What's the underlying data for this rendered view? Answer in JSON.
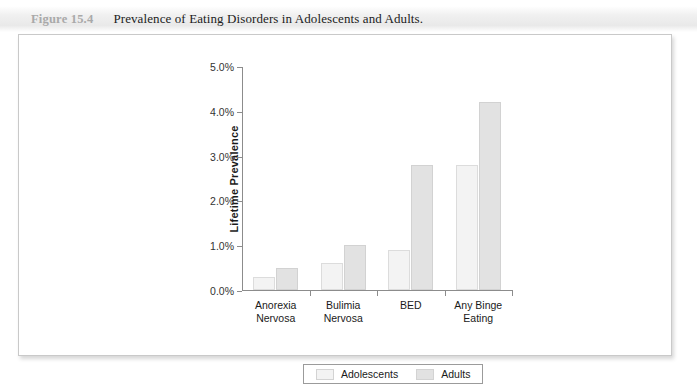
{
  "figure": {
    "number": "Figure 15.4",
    "title": "Prevalence of Eating Disorders in Adolescents and Adults."
  },
  "chart_data": {
    "type": "bar",
    "title": "Prevalence of Eating Disorders in Adolescents and Adults.",
    "xlabel": "",
    "ylabel": "Lifetime Prevalence",
    "ylim": [
      0,
      5
    ],
    "ytick_labels": [
      "0.0%",
      "1.0%",
      "2.0%",
      "3.0%",
      "4.0%",
      "5.0%"
    ],
    "ytick_values": [
      0,
      1,
      2,
      3,
      4,
      5
    ],
    "grid": false,
    "legend_position": "bottom",
    "categories": [
      "Anorexia Nervosa",
      "Bulimia Nervosa",
      "BED",
      "Any Binge Eating"
    ],
    "category_lines": [
      [
        "Anorexia",
        "Nervosa"
      ],
      [
        "Bulimia",
        "Nervosa"
      ],
      [
        "BED",
        ""
      ],
      [
        "Any Binge",
        "Eating"
      ]
    ],
    "series": [
      {
        "name": "Adolescents",
        "color": "#f3f3f3",
        "values": [
          0.3,
          0.6,
          0.9,
          2.8
        ]
      },
      {
        "name": "Adults",
        "color": "#e2e2e2",
        "values": [
          0.5,
          1.0,
          2.8,
          4.2
        ]
      }
    ]
  },
  "legend": {
    "entries": [
      {
        "label": "Adolescents"
      },
      {
        "label": "Adults"
      }
    ]
  }
}
